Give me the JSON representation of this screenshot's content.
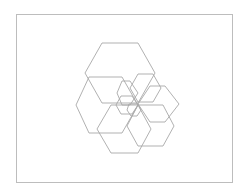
{
  "diagram": {
    "type": "nested-hexagon-spiral",
    "frame": {
      "x": 16,
      "y": 14,
      "width": 216,
      "height": 168,
      "stroke": "#bdbdbd"
    },
    "stroke_color": "#a8a8a8",
    "hexagons": [
      {
        "name": "hexagon-top-large",
        "points": "102,43 138,43 155,73 138,103 102,103 85,73"
      },
      {
        "name": "hexagon-left-large",
        "points": "89,77 122,77 138,105 122,133 89,133 76,105"
      },
      {
        "name": "hexagon-bottom-left",
        "points": "111,105 138,105 151,129 138,153 111,153 97,129"
      },
      {
        "name": "hexagon-bottom-right",
        "points": "138,105 163,105 174,126 163,146 138,146 127,126"
      },
      {
        "name": "hexagon-right",
        "points": "150,86 165,86 179,104 165,122 150,122 138,104"
      },
      {
        "name": "hexagon-upper-right",
        "points": "138,74 153,74 161,88 153,102 138,102 130,88"
      },
      {
        "name": "hexagon-small-upper",
        "points": "122,81 130,81 138,93 130,105 122,105 117,93"
      },
      {
        "name": "hexagon-small-center",
        "points": "121,96 132,96 138,105 132,114 121,114 116,105"
      },
      {
        "name": "hexagon-tiny",
        "points": "129,104 138,104 141,110 137,116 131,116 127,110"
      }
    ]
  }
}
